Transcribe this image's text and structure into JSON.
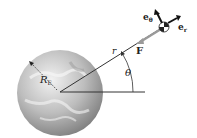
{
  "diagram": {
    "labels": {
      "radius": "R",
      "radius_sub": "E",
      "distance": "r",
      "force": "F",
      "angle": "θ",
      "unit_theta": "e",
      "unit_theta_sub": "θ",
      "unit_r": "e",
      "unit_r_sub": "r"
    },
    "colors": {
      "earth_light": "#e6e6e6",
      "earth_dark": "#8a8a8a",
      "line": "#333333",
      "force_arrow": "#9a9a9a"
    }
  }
}
